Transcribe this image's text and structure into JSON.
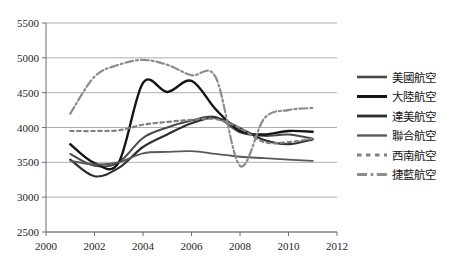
{
  "chart_data": {
    "type": "line",
    "title": "",
    "subtitle": "",
    "xlabel": "",
    "ylabel": "",
    "xlim": [
      2000,
      2012
    ],
    "ylim": [
      2500,
      5500
    ],
    "grid": true,
    "legend_position": "right",
    "x_ticks": [
      "2000",
      "2002",
      "2004",
      "2006",
      "2008",
      "2010",
      "2012"
    ],
    "x_tick_values": [
      2000,
      2002,
      2004,
      2006,
      2008,
      2010,
      2012
    ],
    "y_ticks": [
      "2500",
      "3000",
      "3500",
      "4000",
      "4500",
      "5000",
      "5500"
    ],
    "y_tick_values": [
      2500,
      3000,
      3500,
      4000,
      4500,
      5000,
      5500
    ],
    "x": [
      2001,
      2002,
      2003,
      2004,
      2005,
      2006,
      2007,
      2008,
      2009,
      2010,
      2011
    ],
    "series": [
      {
        "name": "美國航空",
        "color": "#4a4a4a",
        "dash": "none",
        "width": 2.0,
        "values": [
          3620,
          3450,
          3500,
          3850,
          4000,
          4100,
          4150,
          3930,
          3880,
          3900,
          3840
        ]
      },
      {
        "name": "大陸航空",
        "color": "#141414",
        "dash": "none",
        "width": 2.4,
        "values": [
          3760,
          3490,
          3500,
          4640,
          4510,
          4670,
          4260,
          3950,
          3900,
          3950,
          3940
        ]
      },
      {
        "name": "達美航空",
        "color": "#2e2e2e",
        "dash": "none",
        "width": 2.2,
        "values": [
          3540,
          3300,
          3420,
          3720,
          3900,
          4060,
          4140,
          3990,
          3820,
          3760,
          3830
        ]
      },
      {
        "name": "聯合航空",
        "color": "#595959",
        "dash": "none",
        "width": 1.8,
        "values": [
          3520,
          3470,
          3500,
          3630,
          3650,
          3660,
          3620,
          3580,
          3560,
          3540,
          3520
        ]
      },
      {
        "name": "西南航空",
        "color": "#808080",
        "dash": "dotted",
        "width": 2.2,
        "values": [
          3950,
          3950,
          3960,
          4040,
          4080,
          4110,
          4120,
          3990,
          3790,
          3790,
          3840
        ]
      },
      {
        "name": "捷藍航空",
        "color": "#8c8c8c",
        "dash": "dashdot",
        "width": 2.2,
        "values": [
          4200,
          4730,
          4900,
          4970,
          4900,
          4750,
          4720,
          3450,
          4130,
          4250,
          4280
        ]
      }
    ]
  },
  "legend": {
    "items": [
      {
        "label": "美國航空"
      },
      {
        "label": "大陸航空"
      },
      {
        "label": "達美航空"
      },
      {
        "label": "聯合航空"
      },
      {
        "label": "西南航空"
      },
      {
        "label": "捷藍航空"
      }
    ]
  }
}
